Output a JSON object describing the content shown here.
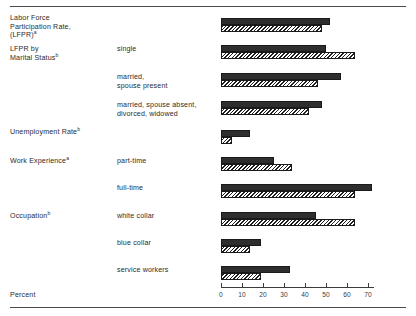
{
  "figure": {
    "axis_title": "Percent",
    "footnote_marks": {
      "a": "a",
      "b": "b"
    }
  },
  "chart_data": {
    "type": "bar",
    "orientation": "horizontal",
    "title": "",
    "xlabel": "Percent",
    "ylabel": "",
    "xlim": [
      0,
      76
    ],
    "xticks": [
      0,
      10,
      20,
      30,
      40,
      50,
      60,
      70
    ],
    "xtick_labels": [
      "0",
      "10",
      "20",
      "30",
      "40",
      "50",
      "60",
      "70"
    ],
    "grid": false,
    "legend": [],
    "series": [
      {
        "name": "solid",
        "style": "solid-black"
      },
      {
        "name": "hatched",
        "style": "diagonal-hatch"
      }
    ],
    "groups": [
      {
        "category": "Labor Force\nParticipation Rate,\n(LFPR)",
        "category_sup": "a",
        "sub": "",
        "values": {
          "solid": 52,
          "hatched": 48
        }
      },
      {
        "category": "LFPR by\nMarital Status",
        "category_sup": "b",
        "sub": "single",
        "values": {
          "solid": 50,
          "hatched": 64
        }
      },
      {
        "category": "",
        "category_sup": "",
        "sub": "married,\nspouse present",
        "values": {
          "solid": 57,
          "hatched": 46
        }
      },
      {
        "category": "",
        "category_sup": "",
        "sub": "married, spouse absent,\ndivorced, widowed",
        "values": {
          "solid": 48,
          "hatched": 42
        }
      },
      {
        "category": "Unemployment Rate",
        "category_sup": "b",
        "sub": "",
        "values": {
          "solid": 14,
          "hatched": 5
        }
      },
      {
        "category": "Work Experience",
        "category_sup": "a",
        "sub": "part-time",
        "values": {
          "solid": 25,
          "hatched": 34
        }
      },
      {
        "category": "",
        "category_sup": "",
        "sub": "full-time",
        "values": {
          "solid": 72,
          "hatched": 64
        }
      },
      {
        "category": "Occupation",
        "category_sup": "b",
        "sub": "white collar",
        "values": {
          "solid": 45,
          "hatched": 64
        }
      },
      {
        "category": "",
        "category_sup": "",
        "sub": "blue collar",
        "values": {
          "solid": 19,
          "hatched": 14
        }
      },
      {
        "category": "",
        "category_sup": "",
        "sub": "service workers",
        "values": {
          "solid": 33,
          "hatched": 19
        }
      }
    ]
  },
  "layout": {
    "x0_px": 221,
    "px_per_unit": 2.1,
    "row_tops": [
      18,
      45,
      73,
      101,
      130,
      157,
      184,
      212,
      239,
      266
    ],
    "label_tops": [
      14,
      45,
      73,
      101,
      128,
      157,
      184,
      212,
      239,
      266
    ],
    "axis_y": 287,
    "tick_label_y": 291,
    "axis_title_y": 291
  }
}
